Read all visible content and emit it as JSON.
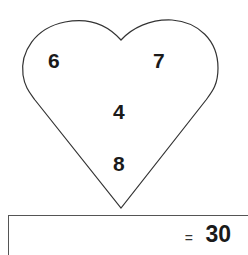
{
  "puzzle": {
    "numbers": {
      "top_left": "6",
      "top_right": "7",
      "middle": "4",
      "bottom": "8"
    },
    "equals_sign": "=",
    "result": "30"
  }
}
